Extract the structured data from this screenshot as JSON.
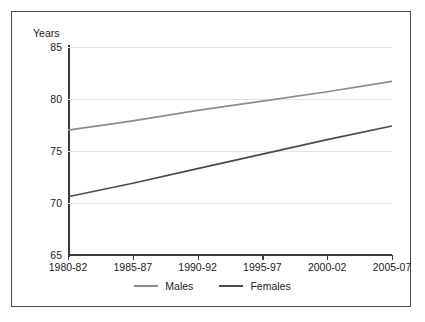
{
  "chart_data": {
    "type": "line",
    "title": "",
    "xlabel": "",
    "ylabel": "Years",
    "ylim": [
      65,
      85
    ],
    "yticks": [
      85,
      80,
      75,
      70,
      65
    ],
    "grid": true,
    "legend_position": "bottom",
    "categories": [
      "1980-82",
      "1985-87",
      "1990-92",
      "1995-97",
      "2000-02",
      "2005-07"
    ],
    "series": [
      {
        "name": "Males",
        "color": "#8c8c8c",
        "values": [
          77.0,
          77.9,
          78.9,
          79.8,
          80.7,
          81.7
        ]
      },
      {
        "name": "Females",
        "color": "#4a4a4a",
        "values": [
          70.6,
          71.9,
          73.3,
          74.7,
          76.1,
          77.4
        ]
      }
    ]
  },
  "axis": {
    "y_title": "Years"
  },
  "legend": {
    "items": [
      {
        "label": "Males",
        "swatch_color": "#8c8c8c"
      },
      {
        "label": "Females",
        "swatch_color": "#4a4a4a"
      }
    ]
  },
  "colors": {
    "frame": "#4a4a4a",
    "axis": "#3a3a3a",
    "gridline": "#e2e2e2",
    "text": "#1b1b1b",
    "background": "#ffffff"
  }
}
